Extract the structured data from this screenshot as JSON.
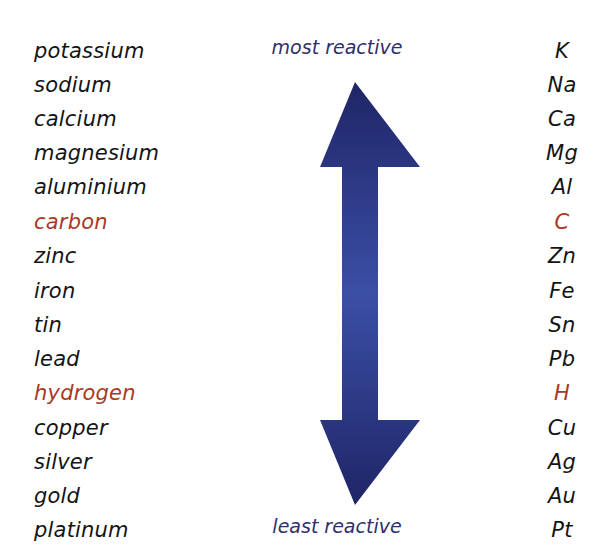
{
  "labels": {
    "top": "most reactive",
    "bottom": "least reactive"
  },
  "colors": {
    "text": "#141414",
    "highlight": "#a83a24",
    "label": "#2e2f6c",
    "arrow_dark": "#1f2566",
    "arrow_light": "#3b4fa6"
  },
  "elements": [
    {
      "name": "potassium",
      "symbol": "K",
      "highlight": false
    },
    {
      "name": "sodium",
      "symbol": "Na",
      "highlight": false
    },
    {
      "name": "calcium",
      "symbol": "Ca",
      "highlight": false
    },
    {
      "name": "magnesium",
      "symbol": "Mg",
      "highlight": false
    },
    {
      "name": "aluminium",
      "symbol": "Al",
      "highlight": false
    },
    {
      "name": "carbon",
      "symbol": "C",
      "highlight": true
    },
    {
      "name": "zinc",
      "symbol": "Zn",
      "highlight": false
    },
    {
      "name": "iron",
      "symbol": "Fe",
      "highlight": false
    },
    {
      "name": "tin",
      "symbol": "Sn",
      "highlight": false
    },
    {
      "name": "lead",
      "symbol": "Pb",
      "highlight": false
    },
    {
      "name": "hydrogen",
      "symbol": "H",
      "highlight": true
    },
    {
      "name": "copper",
      "symbol": "Cu",
      "highlight": false
    },
    {
      "name": "silver",
      "symbol": "Ag",
      "highlight": false
    },
    {
      "name": "gold",
      "symbol": "Au",
      "highlight": false
    },
    {
      "name": "platinum",
      "symbol": "Pt",
      "highlight": false
    }
  ]
}
